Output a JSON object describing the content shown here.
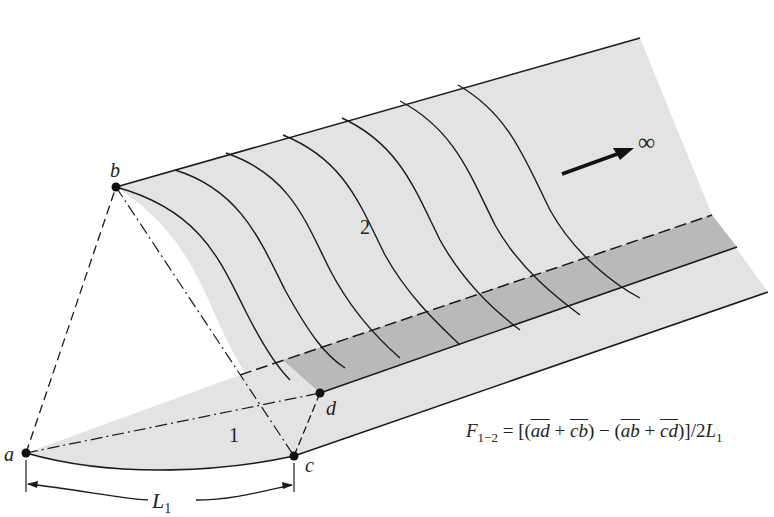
{
  "diagram": {
    "points": {
      "a": {
        "label": "a",
        "x": 26,
        "y": 453
      },
      "b": {
        "label": "b",
        "x": 116,
        "y": 187
      },
      "c": {
        "label": "c",
        "x": 294,
        "y": 456
      },
      "d": {
        "label": "d",
        "x": 320,
        "y": 393
      }
    },
    "surfaces": {
      "surface_1": {
        "label": "1"
      },
      "surface_2": {
        "label": "2"
      }
    },
    "infinity_label": "∞",
    "dimension": {
      "label": "L",
      "subscript": "1"
    },
    "formula": {
      "lhs": "F",
      "lhs_sub": "1−2",
      "equals": " = [(",
      "t1": "ad",
      "plus1": " + ",
      "t2": "cb",
      "mid": ") − (",
      "t3": "ab",
      "plus2": " + ",
      "t4": "cd",
      "end": ")]/2",
      "L": "L",
      "L_sub": "1"
    },
    "colors": {
      "surface_light": "#e3e3e3",
      "band_dark": "#b9b9b9",
      "line": "#1a1a1a"
    }
  }
}
